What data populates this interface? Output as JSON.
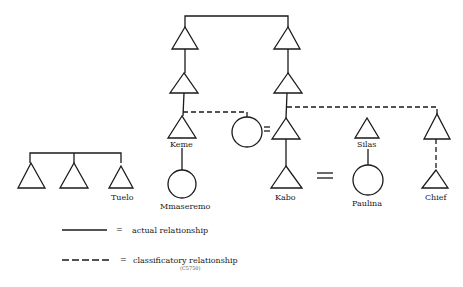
{
  "title_fragment": "FIGURE 4 ...",
  "diagram": {
    "type": "kinship-chart",
    "nodes": [
      {
        "id": "lg1",
        "shape": "triangle",
        "label": ""
      },
      {
        "id": "lg2",
        "shape": "triangle",
        "label": ""
      },
      {
        "id": "tuelo",
        "shape": "triangle",
        "label": "Tuelo"
      },
      {
        "id": "l1",
        "shape": "triangle",
        "label": ""
      },
      {
        "id": "l2",
        "shape": "triangle",
        "label": ""
      },
      {
        "id": "keme",
        "shape": "triangle",
        "label": "Keme"
      },
      {
        "id": "mmaseremo",
        "shape": "circle",
        "label": "Mmaseremo"
      },
      {
        "id": "wife",
        "shape": "circle",
        "label": ""
      },
      {
        "id": "r1",
        "shape": "triangle",
        "label": ""
      },
      {
        "id": "r2",
        "shape": "triangle",
        "label": ""
      },
      {
        "id": "r3",
        "shape": "triangle",
        "label": ""
      },
      {
        "id": "kabo",
        "shape": "triangle",
        "label": "Kabo"
      },
      {
        "id": "silas",
        "shape": "triangle",
        "label": "Silas"
      },
      {
        "id": "paulina",
        "shape": "circle",
        "label": "Paulina"
      },
      {
        "id": "chief_top",
        "shape": "triangle",
        "label": ""
      },
      {
        "id": "chief",
        "shape": "triangle",
        "label": "Chief"
      }
    ],
    "marriage_symbol": "="
  },
  "labels": {
    "tuelo": "Tuelo",
    "keme": "Keme",
    "mmaseremo": "Mmaseremo",
    "kabo": "Kabo",
    "silas": "Silas",
    "paulina": "Paulina",
    "chief": "Chief",
    "equals": "="
  },
  "legend": {
    "actual": {
      "symbol": "=",
      "text": "actual relationship",
      "line": "solid"
    },
    "classificatory": {
      "symbol": "=",
      "text": "classificatory relationship",
      "line": "dashed"
    },
    "tag": "(C5750)"
  }
}
